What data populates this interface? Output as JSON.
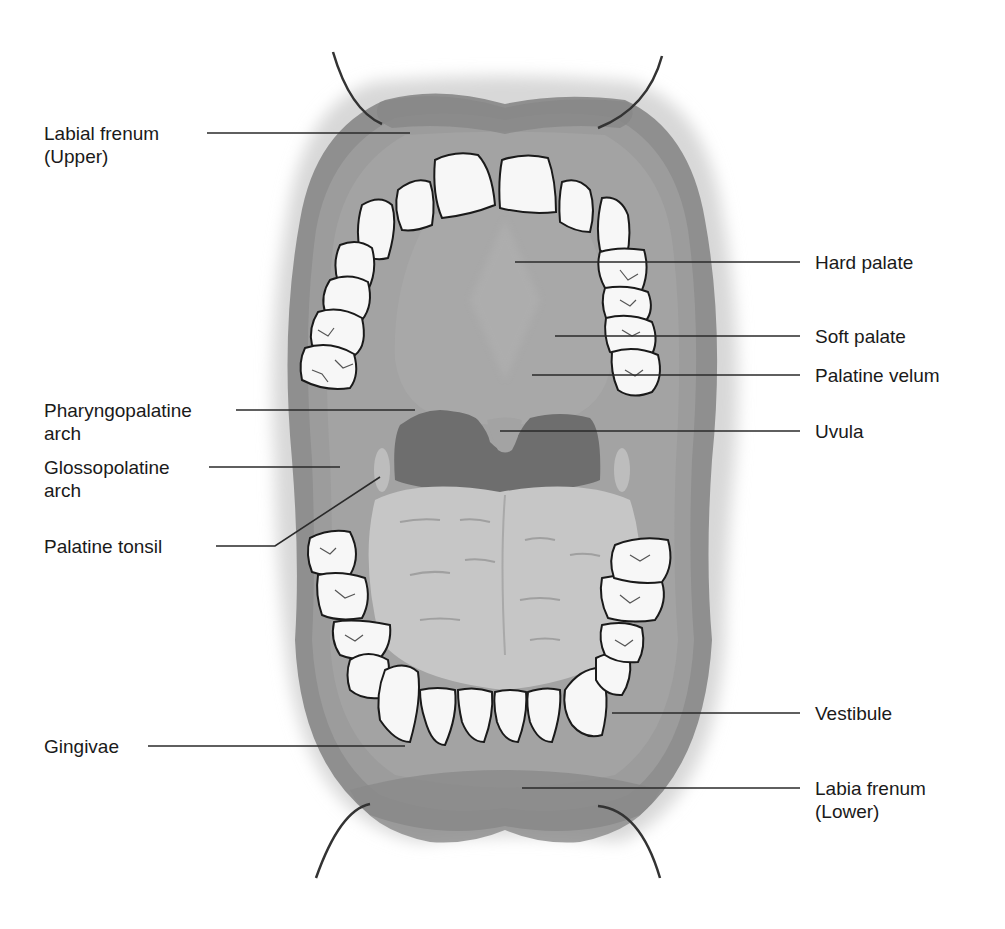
{
  "diagram": {
    "colors": {
      "lips": "#8e8e8e",
      "mucosa": "#9a9a9a",
      "palate": "#a6a6a6",
      "pharynx": "#6f6f6f",
      "tongue": "#c4c4c4",
      "teeth": "#f7f7f7",
      "outline": "#1a1a1a",
      "leader_line": "#2a2a2a"
    },
    "labels_left": [
      {
        "id": "labial-frenum-upper",
        "line1": "Labial frenum",
        "line2": "(Upper)"
      },
      {
        "id": "pharyngopalatine-arch",
        "line1": "Pharyngopalatine",
        "line2": "arch"
      },
      {
        "id": "glossopolatine-arch",
        "line1": "Glossopolatine",
        "line2": "arch"
      },
      {
        "id": "palatine-tonsil",
        "line1": "Palatine tonsil",
        "line2": ""
      },
      {
        "id": "gingivae",
        "line1": "Gingivae",
        "line2": ""
      }
    ],
    "labels_right": [
      {
        "id": "hard-palate",
        "line1": "Hard palate",
        "line2": ""
      },
      {
        "id": "soft-palate",
        "line1": "Soft palate",
        "line2": ""
      },
      {
        "id": "palatine-velum",
        "line1": "Palatine velum",
        "line2": ""
      },
      {
        "id": "uvula",
        "line1": "Uvula",
        "line2": ""
      },
      {
        "id": "vestibule",
        "line1": "Vestibule",
        "line2": ""
      },
      {
        "id": "labia-frenum-lower",
        "line1": "Labia frenum",
        "line2": "(Lower)"
      }
    ]
  }
}
